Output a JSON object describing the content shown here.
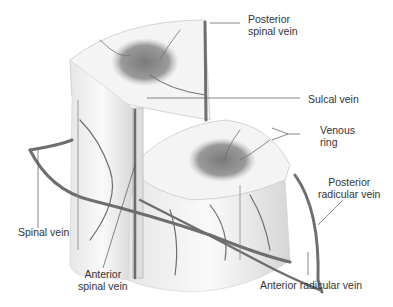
{
  "figure": {
    "labels": {
      "posterior_spinal_vein": [
        "Posterior",
        "spinal vein"
      ],
      "sulcal_vein": "Sulcal vein",
      "venous_ring": [
        "Venous",
        "ring"
      ],
      "posterior_radicular_vein": [
        "Posterior",
        "radicular vein"
      ],
      "spinal_vein": "Spinal vein",
      "anterior_spinal_vein": [
        "Anterior",
        "spinal vein"
      ],
      "anterior_radicular_vein": "Anterior radicular vein"
    },
    "colors": {
      "background": "#ffffff",
      "cord_white": "#f2f2f2",
      "cord_shade": "#d9d9d9",
      "gray_matter": "#8c8c8c",
      "vein": "#6e6e6e",
      "leader_line": "#555555",
      "label_text": "#333333"
    }
  }
}
